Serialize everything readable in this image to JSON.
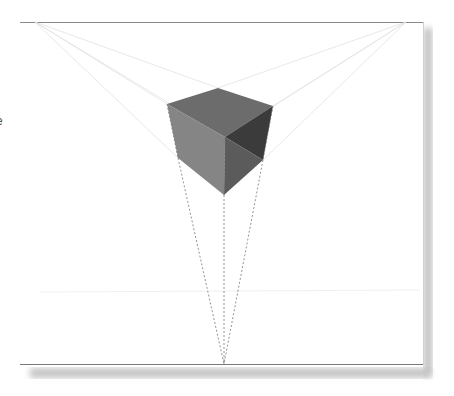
{
  "figure": {
    "stray_text": "e",
    "colors": {
      "frame_line": "#8a8a8a",
      "shadow": "#c8c8c8",
      "top_face": "#6c6c6c",
      "left_face": "#858585",
      "right_face_dark": "#3b3b3b",
      "right_face_mid": "#5b5b5b",
      "construction_line": "#dddddd",
      "dashed_line": "#777777"
    },
    "vanishing_points": {
      "left": [
        35,
        22
      ],
      "right": [
        406,
        22
      ],
      "bottom": [
        224,
        364
      ]
    }
  }
}
